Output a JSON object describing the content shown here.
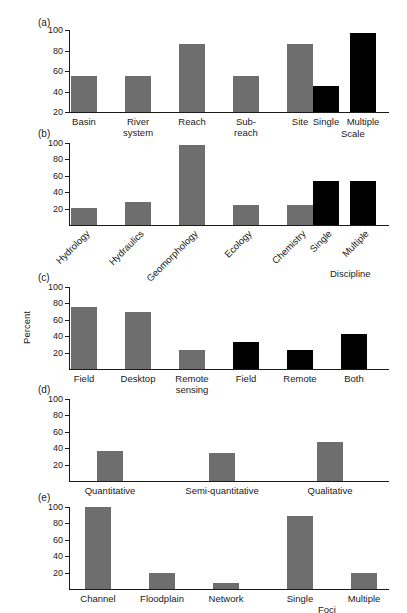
{
  "figure": {
    "ylabel": "Percent",
    "bar_color_gray": "#6e6e6e",
    "bar_color_black": "#000000"
  },
  "chart_data": [
    {
      "type": "bar",
      "panel": "(a)",
      "title": "",
      "xlabel": "Scale",
      "ylabel": "",
      "ylim": [
        20,
        100
      ],
      "yticks": [
        20,
        40,
        60,
        80,
        100
      ],
      "grid": false,
      "legend": "none",
      "categories": [
        "Basin",
        "River\nsystem",
        "Reach",
        "Sub-\nreach",
        "Site",
        "Single",
        "Multiple"
      ],
      "values": [
        55,
        55,
        86,
        55,
        86,
        45,
        97
      ],
      "colors": [
        "#6e6e6e",
        "#6e6e6e",
        "#6e6e6e",
        "#6e6e6e",
        "#6e6e6e",
        "#000000",
        "#000000"
      ]
    },
    {
      "type": "bar",
      "panel": "(b)",
      "title": "",
      "xlabel": "Discipline",
      "ylabel": "",
      "ylim": [
        0,
        100
      ],
      "yticks": [
        20,
        40,
        60,
        80,
        100
      ],
      "grid": false,
      "legend": "none",
      "categories": [
        "Hydrology",
        "Hydraulics",
        "Geomorphology",
        "Ecology",
        "Chemistry",
        "Single",
        "Multiple"
      ],
      "values": [
        21,
        28,
        98,
        24,
        24,
        54,
        54
      ],
      "colors": [
        "#6e6e6e",
        "#6e6e6e",
        "#6e6e6e",
        "#6e6e6e",
        "#6e6e6e",
        "#000000",
        "#000000"
      ]
    },
    {
      "type": "bar",
      "panel": "(c)",
      "title": "",
      "xlabel": "",
      "ylabel": "Percent",
      "ylim": [
        0,
        100
      ],
      "yticks": [
        20,
        40,
        60,
        80,
        100
      ],
      "grid": false,
      "legend": "none",
      "categories": [
        "Field",
        "Desktop",
        "Remote\nsensing",
        "Field",
        "Remote",
        "Both"
      ],
      "values": [
        76,
        69,
        23,
        33,
        23,
        43
      ],
      "colors": [
        "#6e6e6e",
        "#6e6e6e",
        "#6e6e6e",
        "#000000",
        "#000000",
        "#000000"
      ]
    },
    {
      "type": "bar",
      "panel": "(d)",
      "title": "",
      "xlabel": "",
      "ylabel": "",
      "ylim": [
        0,
        100
      ],
      "yticks": [
        20,
        40,
        60,
        80,
        100
      ],
      "grid": false,
      "legend": "none",
      "categories": [
        "Quantitative",
        "Semi-quantitative",
        "Qualitative"
      ],
      "values": [
        37,
        34,
        47
      ],
      "colors": [
        "#6e6e6e",
        "#6e6e6e",
        "#6e6e6e"
      ]
    },
    {
      "type": "bar",
      "panel": "(e)",
      "title": "",
      "xlabel": "Foci",
      "ylabel": "",
      "ylim": [
        0,
        100
      ],
      "yticks": [
        20,
        40,
        60,
        80,
        100
      ],
      "grid": false,
      "legend": "none",
      "categories": [
        "Channel",
        "Floodplain",
        "Network",
        "Single",
        "Multiple"
      ],
      "values": [
        100,
        20,
        7,
        89,
        20
      ],
      "colors": [
        "#6e6e6e",
        "#6e6e6e",
        "#6e6e6e",
        "#6e6e6e",
        "#6e6e6e"
      ]
    }
  ]
}
